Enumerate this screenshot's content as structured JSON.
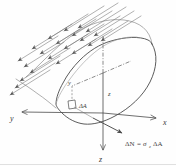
{
  "figure": {
    "background_color": "#fefefe",
    "line_color": "#4a4a4a",
    "label_color": "#3a3a3a",
    "width": 176,
    "height": 166
  },
  "axes": [
    {
      "name": "x-axis",
      "label": "x",
      "direction": "right-down",
      "style": "solid-arrow"
    },
    {
      "name": "y-axis",
      "label": "y",
      "direction": "left-down",
      "style": "solid-arrow"
    },
    {
      "name": "z-axis-down",
      "label": "z",
      "direction": "down",
      "style": "solid-arrow"
    },
    {
      "name": "z-axis-up",
      "label": "",
      "direction": "up",
      "style": "dash-dot"
    },
    {
      "name": "x-axis-back",
      "label": "",
      "direction": "right-up",
      "style": "dash-dot"
    },
    {
      "name": "y-axis-back",
      "label": "",
      "direction": "left-up",
      "style": "dash-dot"
    }
  ],
  "labels": {
    "x_axis": "x",
    "y_axis": "y",
    "z_axis": "z",
    "y_coordinate": "y",
    "z_coordinate": "z",
    "area_element": "ΔA",
    "force_lhs": "ΔN",
    "equals": "=",
    "stress_symbol": "σ",
    "stress_subscript": "z",
    "force_rhs_area": "ΔA",
    "force_equation": "ΔN = σz ΔA"
  },
  "elements": {
    "body": "cut-solid-blob",
    "cross_section": "elliptical-cut-face",
    "area_element_shape": "small-square-patch",
    "distributed_load": {
      "name": "distributed-load-arrows",
      "count": 22,
      "direction": "down-left",
      "description": "parallel arrows representing distributed surface loading"
    },
    "normal_force_arrow": {
      "name": "delta-N-force-arrow",
      "direction": "down-right",
      "description": "internal normal force vector at the area element"
    }
  }
}
